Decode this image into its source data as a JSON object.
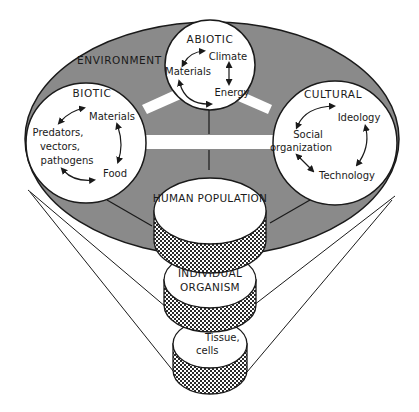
{
  "diagram": {
    "type": "nested ecological systems diagram",
    "colors": {
      "environment_fill": "#8a8a8a",
      "circle_fill": "#ffffff",
      "outline": "#1a1a1a",
      "hatch": "#2a2a2a",
      "background": "#ffffff"
    },
    "environment": {
      "label": "ENVIRONMENT"
    },
    "abiotic": {
      "title": "ABIOTIC",
      "items": [
        "Climate",
        "Materials",
        "Energy"
      ]
    },
    "biotic": {
      "title": "BIOTIC",
      "items": [
        "Materials",
        "Predators,",
        "vectors,",
        "pathogens",
        "Food"
      ]
    },
    "cultural": {
      "title": "CULTURAL",
      "items": [
        "Ideology",
        "Social",
        "organization",
        "Technology"
      ]
    },
    "levels": [
      {
        "label_line1": "HUMAN POPULATION",
        "label_line2": ""
      },
      {
        "label_line1": "INDIVIDUAL",
        "label_line2": "ORGANISM"
      },
      {
        "label_line1": "Tissue,",
        "label_line2": "cells"
      }
    ]
  }
}
